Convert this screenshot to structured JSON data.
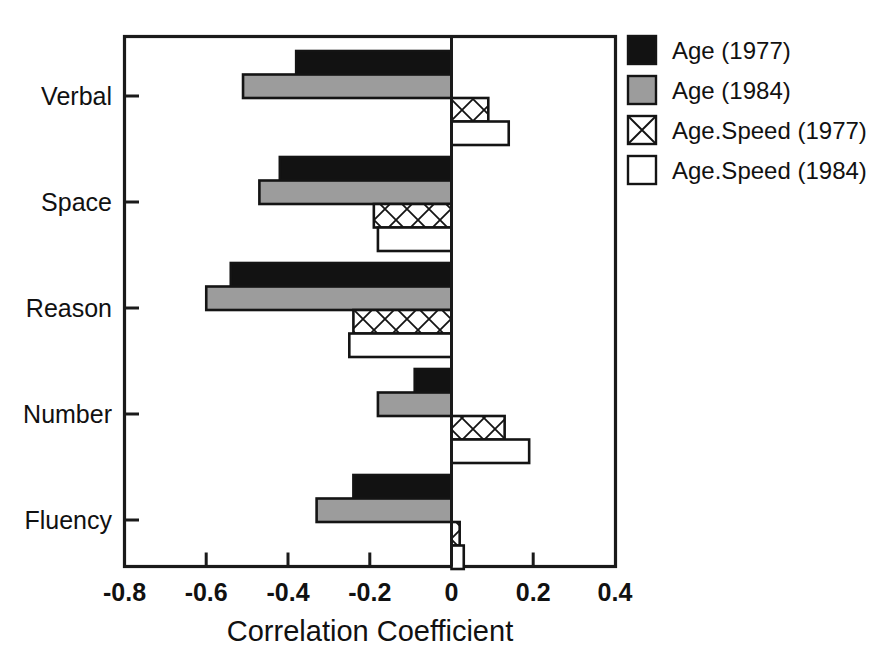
{
  "chart_data": {
    "type": "bar",
    "orientation": "horizontal",
    "title": "",
    "subtitle": "",
    "xlabel": "Correlation Coefficient",
    "ylabel": "",
    "categories": [
      "Verbal",
      "Space",
      "Reason",
      "Number",
      "Fluency"
    ],
    "series": [
      {
        "name": "Age (1977)",
        "key": "age_1977",
        "fill": "#121212",
        "pattern": "solid",
        "values": [
          -0.38,
          -0.42,
          -0.54,
          -0.09,
          -0.24
        ]
      },
      {
        "name": "Age (1984)",
        "key": "age_1984",
        "fill": "#9c9c9c",
        "pattern": "solid",
        "values": [
          -0.51,
          -0.47,
          -0.6,
          -0.18,
          -0.33
        ]
      },
      {
        "name": "Age.Speed (1977)",
        "key": "age_speed_1977",
        "fill": "#ffffff",
        "pattern": "crosshatch",
        "values": [
          0.09,
          -0.19,
          -0.24,
          0.13,
          0.02
        ]
      },
      {
        "name": "Age.Speed (1984)",
        "key": "age_speed_1984",
        "fill": "#ffffff",
        "pattern": "open",
        "values": [
          0.14,
          -0.18,
          -0.25,
          0.19,
          0.03
        ]
      }
    ],
    "xlim": [
      -0.8,
      0.4
    ],
    "xticks": [
      -0.8,
      -0.6,
      -0.4,
      -0.2,
      0,
      0.2,
      0.4
    ],
    "xticklabels": [
      "-0.8",
      "-0.6",
      "-0.4",
      "-0.2",
      "0",
      "0.2",
      "0.4"
    ],
    "grid": false,
    "zero_reference_line": true,
    "legend_position": "right-outside",
    "frame": "box"
  },
  "legend": {
    "items": [
      {
        "label": "Age (1977)",
        "swatch": "legend-swatch-solid-black"
      },
      {
        "label": "Age (1984)",
        "swatch": "legend-swatch-solid-gray"
      },
      {
        "label": "Age.Speed (1977)",
        "swatch": "legend-swatch-crosshatch"
      },
      {
        "label": "Age.Speed (1984)",
        "swatch": "legend-swatch-open"
      }
    ]
  },
  "axis": {
    "x_title": "Correlation Coefficient",
    "tick_labels": [
      "-0.8",
      "-0.6",
      "-0.4",
      "-0.2",
      "0",
      "0.2",
      "0.4"
    ],
    "category_labels": [
      "Verbal",
      "Space",
      "Reason",
      "Number",
      "Fluency"
    ]
  }
}
